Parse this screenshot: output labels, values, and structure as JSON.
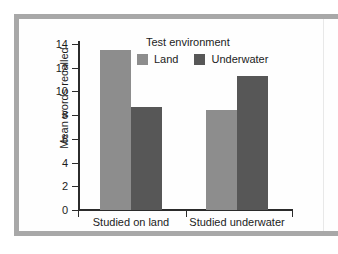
{
  "chart_data": {
    "type": "bar",
    "title": "",
    "xlabel": "",
    "ylabel": "Mean words recalled",
    "ylim": [
      0,
      15
    ],
    "yticks": [
      "0",
      "2",
      "4",
      "6",
      "8",
      "10",
      "12",
      "14"
    ],
    "ytick_values": [
      0,
      2,
      4,
      6,
      8,
      10,
      12,
      14
    ],
    "grid": false,
    "legend_title": "Test environment",
    "legend_position": "upper-center-inside",
    "categories": [
      "Studied on land",
      "Studied underwater"
    ],
    "series": [
      {
        "name": "Land",
        "color": "#8d8d8d",
        "values": [
          13.5,
          8.4
        ]
      },
      {
        "name": "Underwater",
        "color": "#575757",
        "values": [
          8.65,
          11.3
        ]
      }
    ],
    "annotations": []
  },
  "figure": {
    "frame_color": "#a8a8a8",
    "axis_color": "#2b2b2b",
    "background": "#ffffff"
  }
}
